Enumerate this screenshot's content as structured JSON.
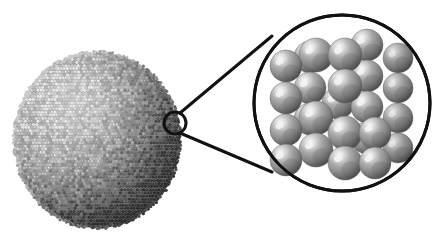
{
  "figure": {
    "type": "scientific-illustration",
    "background_color": "#ffffff",
    "width": 445,
    "height": 240,
    "text_labels": [],
    "caption": ""
  },
  "nanoparticle": {
    "name": "nanoparticle",
    "description": "Large granular sphere composed of many small atoms",
    "center_x": 97,
    "center_y": 140,
    "radius_x": 82,
    "radius_y": 87,
    "fill_color": "#8e8e8e",
    "atom_color_light": "#d2d2d2",
    "atom_color_dark": "#5a5a5a",
    "atom_size": 3.1,
    "atom_rows": 58,
    "atom_cols": 56,
    "edge_roughness": 3
  },
  "callout": {
    "name": "callout-marker",
    "marker_circle": {
      "cx": 175,
      "cy": 123,
      "r": 11,
      "stroke_color": "#111111",
      "stroke_width": 3,
      "fill": "none"
    },
    "leader_lines": [
      {
        "x1": 180,
        "y1": 113,
        "x2": 272,
        "y2": 36,
        "stroke_width": 3
      },
      {
        "x1": 180,
        "y1": 133,
        "x2": 272,
        "y2": 172,
        "stroke_width": 3
      }
    ],
    "stroke_color": "#111111"
  },
  "magnified_inset": {
    "name": "magnified-lattice-inset",
    "circle": {
      "cx": 342,
      "cy": 103,
      "r": 88,
      "stroke_color": "#111111",
      "stroke_width": 3,
      "fill": "#ffffff"
    },
    "lattice": {
      "description": "Cubic close-packed atomic lattice of spheres",
      "sphere_radius": 16,
      "sphere_base_color": "#8c8c8c",
      "sphere_highlight_color": "#f4f4f4",
      "sphere_shadow_color": "#4a4a4a",
      "sphere_outline_color": "#5f5f5f",
      "columns": 3,
      "rows": 5,
      "layers": 2,
      "spheres": [
        {
          "cx": 398,
          "cy": 58,
          "r": 15,
          "layer": "back"
        },
        {
          "cx": 398,
          "cy": 88,
          "r": 15,
          "layer": "back"
        },
        {
          "cx": 398,
          "cy": 118,
          "r": 15,
          "layer": "back"
        },
        {
          "cx": 398,
          "cy": 148,
          "r": 15,
          "layer": "back"
        },
        {
          "cx": 367,
          "cy": 45,
          "r": 16,
          "layer": "mid"
        },
        {
          "cx": 367,
          "cy": 76,
          "r": 16,
          "layer": "mid"
        },
        {
          "cx": 367,
          "cy": 107,
          "r": 16,
          "layer": "mid"
        },
        {
          "cx": 367,
          "cy": 138,
          "r": 16,
          "layer": "mid"
        },
        {
          "cx": 310,
          "cy": 57,
          "r": 16,
          "layer": "mid"
        },
        {
          "cx": 310,
          "cy": 88,
          "r": 16,
          "layer": "mid"
        },
        {
          "cx": 310,
          "cy": 119,
          "r": 16,
          "layer": "mid"
        },
        {
          "cx": 338,
          "cy": 103,
          "r": 16,
          "layer": "mid"
        },
        {
          "cx": 286,
          "cy": 66,
          "r": 16,
          "layer": "front"
        },
        {
          "cx": 286,
          "cy": 98,
          "r": 16,
          "layer": "front"
        },
        {
          "cx": 286,
          "cy": 130,
          "r": 16,
          "layer": "front"
        },
        {
          "cx": 286,
          "cy": 160,
          "r": 16,
          "layer": "front"
        },
        {
          "cx": 316,
          "cy": 55,
          "r": 17,
          "layer": "front"
        },
        {
          "cx": 316,
          "cy": 150,
          "r": 17,
          "layer": "front"
        },
        {
          "cx": 345,
          "cy": 55,
          "r": 17,
          "layer": "front"
        },
        {
          "cx": 345,
          "cy": 86,
          "r": 17,
          "layer": "front"
        },
        {
          "cx": 345,
          "cy": 133,
          "r": 17,
          "layer": "front"
        },
        {
          "cx": 345,
          "cy": 163,
          "r": 17,
          "layer": "front"
        },
        {
          "cx": 316,
          "cy": 118,
          "r": 17,
          "layer": "front"
        },
        {
          "cx": 375,
          "cy": 163,
          "r": 16,
          "layer": "front"
        },
        {
          "cx": 375,
          "cy": 133,
          "r": 16,
          "layer": "front"
        }
      ]
    }
  }
}
